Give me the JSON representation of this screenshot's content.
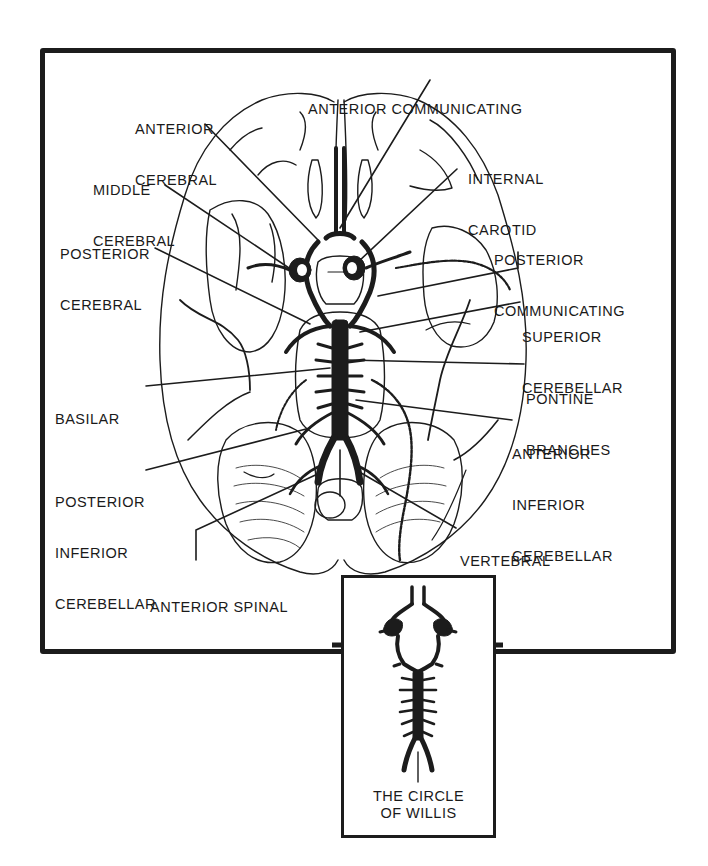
{
  "figure": {
    "colors": {
      "ink": "#1c1c1c",
      "paper": "#ffffff"
    }
  },
  "labels": {
    "anterior_communicating": {
      "lines": [
        "ANTERIOR COMMUNICATING"
      ]
    },
    "anterior_cerebral": {
      "lines": [
        "ANTERIOR",
        "CEREBRAL"
      ]
    },
    "internal_carotid": {
      "lines": [
        "INTERNAL",
        "CAROTID"
      ]
    },
    "middle_cerebral": {
      "lines": [
        "MIDDLE",
        "CEREBRAL"
      ]
    },
    "posterior_cerebral": {
      "lines": [
        "POSTERIOR",
        "CEREBRAL"
      ]
    },
    "posterior_communicating": {
      "lines": [
        "POSTERIOR",
        "COMMUNICATING"
      ]
    },
    "superior_cerebellar": {
      "lines": [
        "SUPERIOR",
        "CEREBELLAR"
      ]
    },
    "pontine_branches": {
      "lines": [
        "PONTINE",
        "BRANCHES"
      ]
    },
    "basilar": {
      "lines": [
        "BASILAR"
      ]
    },
    "anterior_inferior_cerebellar": {
      "lines": [
        "ANTERIOR",
        "INFERIOR",
        "CEREBELLAR"
      ]
    },
    "posterior_inferior_cerebellar": {
      "lines": [
        "POSTERIOR",
        "INFERIOR",
        "CEREBELLAR"
      ]
    },
    "vertebral": {
      "lines": [
        "VERTEBRAL"
      ]
    },
    "anterior_spinal": {
      "lines": [
        "ANTERIOR SPINAL"
      ]
    }
  },
  "inset": {
    "caption_lines": [
      "THE CIRCLE",
      "OF WILLIS"
    ]
  }
}
